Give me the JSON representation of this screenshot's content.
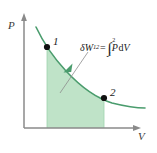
{
  "figure": {
    "type": "pv-diagram",
    "background": "#ffffff",
    "width": 157,
    "height": 153
  },
  "colors": {
    "axis": "#8a8a8a",
    "curve": "#4a9c6d",
    "fill": "#bfe3c8",
    "point": "#111111",
    "leader": "#8d8d8d",
    "arrowhead": "#4a9c6d",
    "text": "#1a1a1a",
    "axis_label_text": "#3a3a3a"
  },
  "axes": {
    "y": {
      "label": "P",
      "x_px": 24,
      "top_px": 14,
      "bottom_px": 128,
      "arrow": true
    },
    "x": {
      "label": "V",
      "y_px": 128,
      "left_px": 24,
      "right_px": 140,
      "arrow": true
    },
    "ticks": [],
    "grid": false
  },
  "curve": {
    "name": "process-curve",
    "shape": "decreasing-convex",
    "start": {
      "x": 36,
      "y": 27
    },
    "end": {
      "x": 145,
      "y": 108
    },
    "path": "M 36 27 C 44 44, 52 56, 66 71 C 80 86, 96 98, 112 103 C 124 106, 136 108, 145 108",
    "stroke_width": 1.6
  },
  "shaded_area": {
    "name": "work-area",
    "meaning": "area under curve equals boundary work",
    "x_from": 47,
    "x_to": 104,
    "baseline_y": 128,
    "path": "M 47 47 C 55 58, 60 64, 66 71 C 80 86, 92 95, 104 98 L 104 128 L 47 128 Z"
  },
  "points": [
    {
      "id": "state-1",
      "label": "1",
      "x": 47,
      "y": 47,
      "label_x": 53,
      "label_y": 36,
      "radius": 3.1
    },
    {
      "id": "state-2",
      "label": "2",
      "x": 104,
      "y": 98,
      "label_x": 110,
      "label_y": 87,
      "radius": 3.1
    }
  ],
  "annotation": {
    "name": "work-equation",
    "text_plain": "δW12 = ∫(1 to 2) P dV",
    "parts": {
      "delta": "δ",
      "w": "W",
      "w_subscript": "12",
      "equals": "=",
      "integral_glyph": "∫",
      "integral_lower": "1",
      "integral_upper": "2",
      "integrand_p": "P",
      "differential_d": "d",
      "differential_v": "V"
    },
    "position": {
      "x": 80,
      "y": 41
    },
    "leader_line": {
      "from": {
        "x": 88,
        "y": 52
      },
      "to": {
        "x": 60,
        "y": 93
      }
    },
    "arrowhead_at": {
      "x": 66,
      "y": 68
    }
  }
}
